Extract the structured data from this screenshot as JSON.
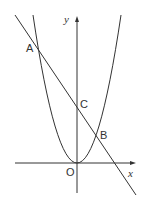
{
  "diagram": {
    "axis_labels": {
      "x": "x",
      "y": "y"
    },
    "points": {
      "A": "A",
      "B": "B",
      "C": "C",
      "O": "O"
    },
    "colors": {
      "stroke": "#333333",
      "background": "#ffffff"
    }
  }
}
